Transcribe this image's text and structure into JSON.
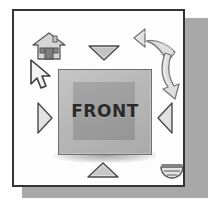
{
  "figure": {
    "frame_border_color": "#343434",
    "frame_background_color": "#fdfdfd",
    "drop_shadow_color": "#a8a8a8"
  },
  "viewcube": {
    "face_label": "FRONT",
    "face_fill_color": "#b9b9b9",
    "inner_face_color": "#9d9d9d",
    "outline_color": "#6e6e6e",
    "label_color": "#2a2a2a"
  },
  "controls": {
    "nav_arrow_top": {
      "name": "Top nav arrow",
      "direction": "down"
    },
    "nav_arrow_bottom": {
      "name": "Bottom nav arrow",
      "direction": "up"
    },
    "nav_arrow_left": {
      "name": "Left nav arrow",
      "direction": "right"
    },
    "nav_arrow_right": {
      "name": "Right nav arrow",
      "direction": "left"
    },
    "rotate_ccw": {
      "name": "Rotate counter-clockwise",
      "direction": "counter-clockwise"
    },
    "rotate_cw": {
      "name": "Rotate clockwise",
      "direction": "clockwise"
    },
    "home": {
      "name": "Home view"
    },
    "cursor": {
      "name": "Mouse pointer"
    },
    "compass": {
      "name": "Compass ring"
    }
  },
  "icons": {
    "home": "home-icon",
    "cursor": "cursor-arrow-icon",
    "compass": "compass-icon",
    "triangle_down": "triangle-down-icon",
    "triangle_up": "triangle-up-icon",
    "triangle_right": "triangle-right-icon",
    "triangle_left": "triangle-left-icon",
    "rotate_ccw": "rotate-counter-clockwise-icon",
    "rotate_cw": "rotate-clockwise-icon"
  }
}
